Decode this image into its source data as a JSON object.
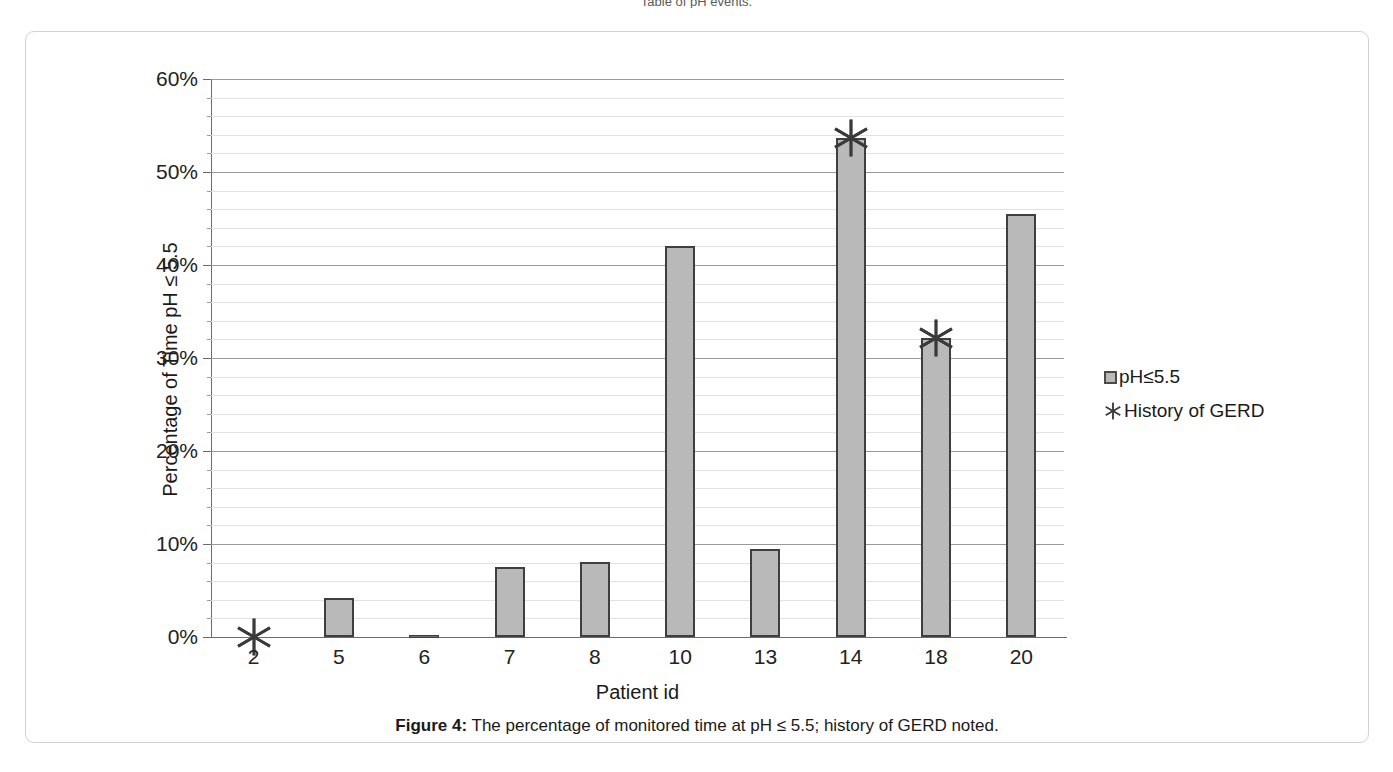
{
  "top_cropped_text": "Table of pH events.",
  "figure": {
    "caption_label": "Figure 4:",
    "caption_text": " The percentage of monitored time at pH ≤ 5.5; history of GERD noted."
  },
  "legend": {
    "items": [
      {
        "label": "pH≤5.5",
        "marker": "square-swatch-icon",
        "color": "#b9b9b9"
      },
      {
        "label": "History of GERD",
        "marker": "asterisk-icon",
        "color": "#3f3f3f"
      }
    ]
  },
  "chart_data": {
    "type": "bar",
    "title": "",
    "xlabel": "Patient id",
    "ylabel": "Percentage of Time pH ≤ 5.5",
    "categories": [
      "2",
      "5",
      "6",
      "7",
      "8",
      "10",
      "13",
      "14",
      "18",
      "20"
    ],
    "values": [
      0,
      4.2,
      0.2,
      7.5,
      8.1,
      42.0,
      9.5,
      53.7,
      32.2,
      45.5
    ],
    "value_unit": "percent",
    "series": [
      {
        "name": "pH≤5.5",
        "values": [
          0,
          4.2,
          0.2,
          7.5,
          8.1,
          42.0,
          9.5,
          53.7,
          32.2,
          45.5
        ]
      }
    ],
    "markers": {
      "name": "History of GERD",
      "categories": [
        "2",
        "14",
        "18"
      ],
      "values": [
        0,
        53.7,
        32.2
      ]
    },
    "ylim": [
      0,
      60
    ],
    "ytick_labels": [
      "0%",
      "10%",
      "20%",
      "30%",
      "40%",
      "50%",
      "60%"
    ],
    "ytick_values": [
      0,
      10,
      20,
      30,
      40,
      50,
      60
    ],
    "yminor_step": 2,
    "grid": "horizontal-major-and-minor",
    "legend_position": "right"
  }
}
